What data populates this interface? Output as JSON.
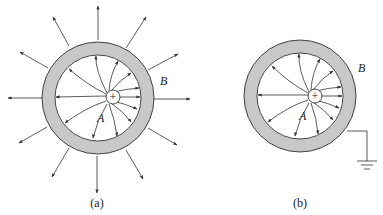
{
  "figures": [
    {
      "id": "a",
      "caption": "(a)",
      "inner_label": "A",
      "outer_label": "B",
      "charge_symbol": "+",
      "grounded": false,
      "description": "Point charge inside ungrounded conducting shell; field lines inside and outside"
    },
    {
      "id": "b",
      "caption": "(b)",
      "inner_label": "A",
      "outer_label": "B",
      "charge_symbol": "+",
      "grounded": true,
      "description": "Point charge inside grounded conducting shell; field lines only inside"
    }
  ],
  "colors": {
    "shell_fill": "#c8c8c8",
    "line": "#333333",
    "background": "#ffffff"
  }
}
